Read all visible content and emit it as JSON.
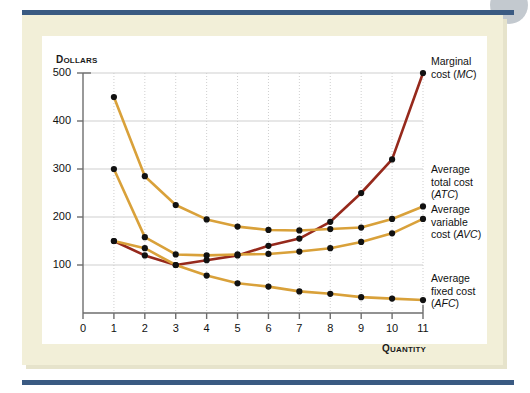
{
  "figure": {
    "background_color": "#ffffff",
    "panel_color": "#f2efd8",
    "rule_color": "#3a5a82",
    "plot_background": "#ffffff"
  },
  "axis_titles": {
    "y_first": "D",
    "y_rest": "OLLARS",
    "x_first": "Q",
    "x_rest": "UANTITY"
  },
  "labels": {
    "mc_line1": "Marginal",
    "mc_line2_pre": "cost (",
    "mc_line2_ital": "MC",
    "mc_line2_post": ")",
    "atc_line1": "Average",
    "atc_line2": "total cost",
    "atc_line3_pre": "(",
    "atc_line3_ital": "ATC",
    "atc_line3_post": ")",
    "avc_line1": "Average",
    "avc_line2": "variable",
    "avc_line3_pre": "cost (",
    "avc_line3_ital": "AVC",
    "avc_line3_post": ")",
    "afc_line1": "Average",
    "afc_line2": "fixed cost",
    "afc_line3_pre": "(",
    "afc_line3_ital": "AFC",
    "afc_line3_post": ")"
  },
  "chart_data": {
    "type": "line",
    "title": "",
    "xlabel": "Quantity",
    "ylabel": "Dollars",
    "xlim": [
      0,
      11
    ],
    "ylim": [
      0,
      500
    ],
    "xticks": [
      0,
      1,
      2,
      3,
      4,
      5,
      6,
      7,
      8,
      9,
      10,
      11
    ],
    "yticks": [
      100,
      200,
      300,
      400,
      500
    ],
    "xtick_labels": [
      "0",
      "1",
      "2",
      "3",
      "4",
      "5",
      "6",
      "7",
      "8",
      "9",
      "10",
      "11"
    ],
    "ytick_labels": [
      "100",
      "200",
      "300",
      "400",
      "500"
    ],
    "grid": true,
    "legend": "right-side curve annotations",
    "marker": "filled-circle",
    "colors": {
      "marginal_cost": "#96291c",
      "average_total_cost": "#d9a13a",
      "average_variable_cost": "#d9a13a",
      "average_fixed_cost": "#d9a13a",
      "marker": "#111111",
      "grid": "#cfcfcf",
      "axis": "#6e6e6e"
    },
    "x": [
      1,
      2,
      3,
      4,
      5,
      6,
      7,
      8,
      9,
      10,
      11
    ],
    "series": [
      {
        "name": "Marginal cost (MC)",
        "key": "MC",
        "color": "#96291c",
        "values": [
          150,
          120,
          100,
          110,
          120,
          140,
          155,
          190,
          250,
          320,
          500
        ]
      },
      {
        "name": "Average total cost (ATC)",
        "key": "ATC",
        "color": "#d9a13a",
        "values": [
          450,
          285,
          225,
          195,
          180,
          173,
          172,
          175,
          178,
          196,
          222
        ]
      },
      {
        "name": "Average variable cost (AVC)",
        "key": "AVC",
        "color": "#d9a13a",
        "values": [
          300,
          158,
          122,
          120,
          122,
          123,
          128,
          135,
          148,
          166,
          196
        ]
      },
      {
        "name": "Average fixed cost (AFC)",
        "key": "AFC",
        "color": "#d9a13a",
        "values": [
          150,
          135,
          100,
          78,
          62,
          55,
          45,
          40,
          33,
          30,
          27
        ]
      }
    ]
  }
}
